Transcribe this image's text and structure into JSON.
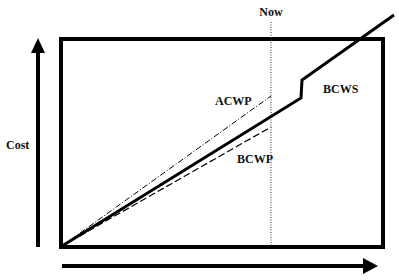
{
  "diagram": {
    "labels": {
      "now": "Now",
      "y_axis": "Cost",
      "acwp": "ACWP",
      "bcws": "BCWS",
      "bcwp": "BCWP"
    },
    "series": [
      {
        "name": "BCWS",
        "style": "solid thick",
        "description": "Budgeted Cost of Work Scheduled"
      },
      {
        "name": "ACWP",
        "style": "dash-dot",
        "description": "Actual Cost of Work Performed"
      },
      {
        "name": "BCWP",
        "style": "dashed",
        "description": "Budgeted Cost of Work Performed"
      }
    ],
    "colors": {
      "line": "#000000",
      "background": "#ffffff"
    }
  }
}
